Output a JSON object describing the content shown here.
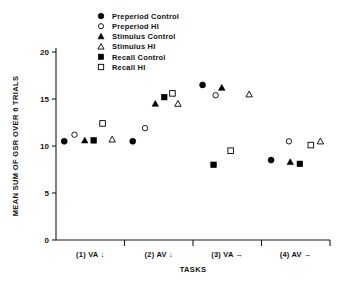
{
  "chart_data": {
    "type": "scatter",
    "title": "",
    "xlabel": "TASKS",
    "ylabel": "MEAN SUM OF GSR OVER 6 TRIALS",
    "ylim": [
      0,
      20
    ],
    "yticks": [
      0,
      5,
      10,
      15,
      20
    ],
    "ytick_labels": [
      "0",
      "5",
      "10",
      "15",
      "20"
    ],
    "grid": false,
    "legend_position": "top-center",
    "categories": [
      "(1) VA ↓",
      "(2) AV ↓",
      "(3) VA →",
      "(4) AV →"
    ],
    "series": [
      {
        "name": "Preperiod Control",
        "marker": "filled-circle",
        "color": "#000000",
        "values": [
          10.5,
          10.5,
          16.5,
          8.5
        ],
        "x": [
          0.12,
          0.12,
          0.14,
          0.14
        ]
      },
      {
        "name": "Preperiod HI",
        "marker": "open-circle",
        "color": "#000000",
        "values": [
          11.2,
          11.9,
          15.4,
          10.5
        ],
        "x": [
          0.27,
          0.3,
          0.33,
          0.4
        ]
      },
      {
        "name": "Stimulus Control",
        "marker": "filled-triangle",
        "color": "#000000",
        "values": [
          10.6,
          14.5,
          16.2,
          8.3
        ],
        "x": [
          0.42,
          0.45,
          0.42,
          0.42
        ]
      },
      {
        "name": "Stimulus HI",
        "marker": "open-triangle",
        "color": "#000000",
        "values": [
          10.7,
          14.5,
          15.5,
          10.5
        ],
        "x": [
          0.82,
          0.78,
          0.82,
          0.86
        ]
      },
      {
        "name": "Recall Control",
        "marker": "filled-square",
        "color": "#000000",
        "values": [
          10.6,
          15.2,
          8.0,
          8.1
        ],
        "x": [
          0.55,
          0.58,
          0.3,
          0.56
        ]
      },
      {
        "name": "Recall HI",
        "marker": "open-square",
        "color": "#000000",
        "values": [
          12.4,
          15.6,
          9.5,
          10.1
        ],
        "x": [
          0.68,
          0.7,
          0.55,
          0.72
        ]
      }
    ]
  },
  "legend": {
    "items": [
      {
        "label": "Preperiod Control",
        "marker": "filled-circle"
      },
      {
        "label": "Preperiod HI",
        "marker": "open-circle"
      },
      {
        "label": "Stimulus Control",
        "marker": "filled-triangle"
      },
      {
        "label": "Stimulus HI",
        "marker": "open-triangle"
      },
      {
        "label": "Recall Control",
        "marker": "filled-square"
      },
      {
        "label": "Recall HI",
        "marker": "open-square"
      }
    ]
  }
}
